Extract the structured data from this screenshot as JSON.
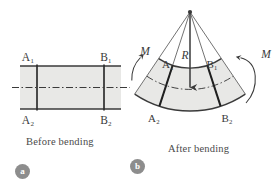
{
  "figure": {
    "background": "#ffffff",
    "ink_color": "#3a3a3a",
    "fill_color": "#e8e8e6",
    "badge_color": "#8d8d8d"
  },
  "panel_a": {
    "badge": "a",
    "caption": "Before bending",
    "labels": {
      "top_left": "A₁",
      "top_right": "B₁",
      "bottom_left": "A₂",
      "bottom_right": "B₂"
    },
    "geometry": {
      "rect_x": 20,
      "rect_y": 66,
      "rect_w": 101,
      "rect_h": 43,
      "left_section_x": 37,
      "right_section_x": 104,
      "neutral_axis_y": 87,
      "neutral_axis_x1": 12,
      "neutral_axis_x2": 130
    }
  },
  "panel_b": {
    "badge": "b",
    "caption": "After bending",
    "labels": {
      "top_left": "A₁",
      "top_right": "B₁",
      "bottom_left": "A₂",
      "bottom_right": "B₂",
      "radius": "R",
      "moment_left": "M",
      "moment_right": "M"
    },
    "geometry": {
      "center_x": 190,
      "center_y": 12,
      "inner_radius": 56,
      "outer_radius": 99,
      "neutral_radius": 77,
      "start_angle_deg": 56,
      "end_angle_deg": 124,
      "section_left_angle_deg": 72,
      "section_right_angle_deg": 108,
      "radius_arrow_from": [
        190,
        12
      ],
      "radius_arrow_to": [
        190,
        89
      ]
    }
  }
}
